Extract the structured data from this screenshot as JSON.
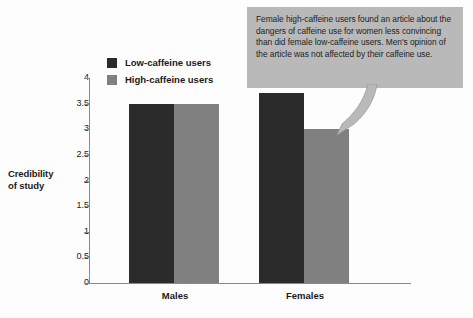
{
  "chart_data": {
    "type": "bar",
    "title": "",
    "subtitle": "",
    "xlabel": "",
    "ylabel": "Credibility of study",
    "ylabel_lines": [
      "Credibility",
      "of study"
    ],
    "categories": [
      "Males",
      "Females"
    ],
    "series": [
      {
        "name": "Low-caffeine users",
        "color": "#2b2b2b",
        "values": [
          3.5,
          3.7
        ]
      },
      {
        "name": "High-caffeine users",
        "color": "#808080",
        "values": [
          3.5,
          3.0
        ]
      }
    ],
    "ylim": [
      0,
      4
    ],
    "ytick_step": 0.5,
    "ytick_labels": [
      "0",
      "0.5",
      "1",
      "1.5",
      "2",
      "2.5",
      "3",
      "3.5",
      "4"
    ],
    "ytick_values": [
      0,
      0.5,
      1,
      1.5,
      2,
      2.5,
      3,
      3.5,
      4
    ],
    "grid": false,
    "legend_position": "top-left-inside",
    "annotations": [
      {
        "text": "Female high-caffeine users found an article about the dangers of caffeine use for women less convincing than did female low-caffeine users. Men's opinion of the article was not affected by their caffeine use.",
        "background": "#b9b9b9",
        "points_to": "Females high-caffeine bar"
      }
    ]
  },
  "legend": {
    "items": [
      {
        "label": "Low-caffeine users",
        "color": "#2b2b2b"
      },
      {
        "label": "High-caffeine users",
        "color": "#808080"
      }
    ]
  },
  "axis": {
    "y_title_line1": "Credibility",
    "y_title_line2": "of study",
    "y_ticks": [
      "4",
      "3.5",
      "3",
      "2.5",
      "2",
      "1.5",
      "1",
      "0.5",
      "0"
    ],
    "x_categories": [
      "Males",
      "Females"
    ]
  },
  "callout": {
    "text": "Female high-caffeine users found an article about the dangers of caffeine use for women less convincing than did female low-caffeine users. Men's opinion of the article was not affected by their caffeine use."
  },
  "colors": {
    "low_caffeine": "#2b2b2b",
    "high_caffeine": "#808080",
    "callout_bg": "#b9b9b9",
    "axis": "#8a8a8a",
    "page_bg": "#fdfdfd"
  }
}
